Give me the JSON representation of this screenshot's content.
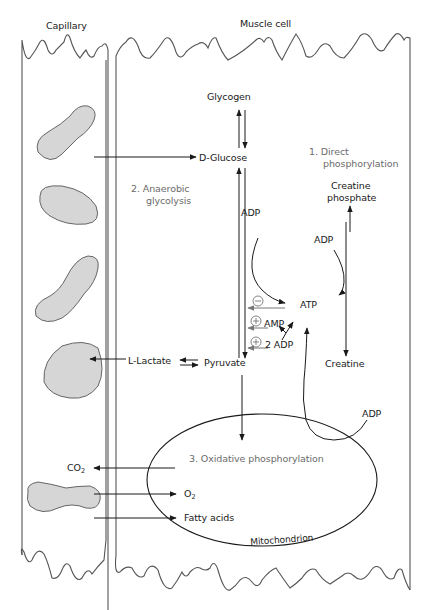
{
  "regions": {
    "capillary": "Capillary",
    "muscle_cell": "Muscle cell",
    "mitochondrion": "Mitochondrion"
  },
  "pathways": {
    "direct": {
      "number": "1.",
      "line1": "Direct",
      "line2": "phosphorylation"
    },
    "anaerobic": {
      "number": "2.",
      "line1": "Anaerobic",
      "line2": "glycolysis"
    },
    "oxidative": {
      "number": "3.",
      "label": "Oxidative phosphorylation"
    }
  },
  "molecules": {
    "glycogen": "Glycogen",
    "glucose": "D-Glucose",
    "creatine_phosphate_1": "Creatine",
    "creatine_phosphate_2": "phosphate",
    "creatine": "Creatine",
    "atp": "ATP",
    "adp_glycolysis": "ADP",
    "adp_creatine": "ADP",
    "adp_mito": "ADP",
    "amp": "AMP",
    "two_adp": "2 ADP",
    "lactate": "L-Lactate",
    "pyruvate": "Pyruvate",
    "co2_main": "CO",
    "co2_sub": "2",
    "o2_main": "O",
    "o2_sub": "2",
    "fatty_acids": "Fatty acids"
  },
  "regulators": {
    "atp_inhibit": "⊖",
    "amp_activate": "⊕",
    "adp_activate": "⊕"
  },
  "colors": {
    "line": "#1a1a1a",
    "regulation_line": "#777777",
    "cell_fill": "#d6d6d6",
    "cell_stroke": "#666666",
    "membrane": "#555555"
  }
}
